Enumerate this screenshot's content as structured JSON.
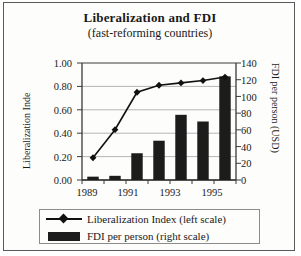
{
  "figure": {
    "title": "Liberalization and FDI",
    "subtitle": "(fast-reforming countries)"
  },
  "axes": {
    "left_title": "Liberalization Inde",
    "right_title": "FDI per person (USD)",
    "left_ticks": [
      "1.00",
      "0.80",
      "0.60",
      "0.40",
      "0.20",
      "0.00"
    ],
    "right_ticks": [
      "140",
      "120",
      "100",
      "80",
      "60",
      "40",
      "20",
      "0"
    ],
    "x_ticks": [
      "1989",
      "1991",
      "1993",
      "1995"
    ]
  },
  "legend": {
    "items": [
      {
        "label": "Liberalization Index (left scale)",
        "marker": "line-diamond-marker"
      },
      {
        "label": "FDI per person (right scale)",
        "marker": "bar-swatch"
      }
    ]
  },
  "colors": {
    "bar": "#1c1c1c",
    "line": "#111111",
    "grid": "#b4b4b4",
    "axis": "#3a3a3a",
    "frame": "#5a5a5a",
    "background": "#fdfdfc"
  },
  "chart_data": {
    "type": "bar",
    "title": "Liberalization and FDI (fast-reforming countries)",
    "subtitle": "(fast-reforming countries)",
    "xlabel": "",
    "categories": [
      "1989",
      "1990",
      "1991",
      "1992",
      "1993",
      "1994",
      "1995"
    ],
    "x_tick_labels": [
      "1989",
      "1991",
      "1993",
      "1995"
    ],
    "grid": true,
    "legend_position": "bottom",
    "series": [
      {
        "name": "FDI per person (right scale)",
        "type": "bar",
        "axis": "right",
        "ylabel": "FDI per person (USD)",
        "ylim": [
          0,
          140
        ],
        "ytick_step": 20,
        "color": "#1c1c1c",
        "values": [
          4,
          5,
          32,
          47,
          78,
          70,
          124
        ]
      },
      {
        "name": "Liberalization Index (left scale)",
        "type": "line",
        "axis": "left",
        "ylabel": "Liberalization Inde",
        "ylim": [
          0.0,
          1.0
        ],
        "ytick_step": 0.2,
        "color": "#111111",
        "marker": "diamond",
        "values": [
          0.19,
          0.43,
          0.75,
          0.81,
          0.83,
          0.85,
          0.88
        ]
      }
    ]
  }
}
